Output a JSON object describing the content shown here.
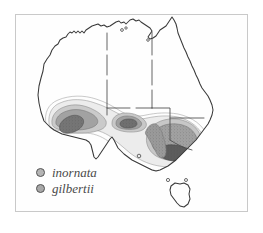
{
  "figure": {
    "type": "distribution-map",
    "region": "Australia",
    "frame": {
      "visible": true,
      "color": "#c9c9c9"
    },
    "background_color": "#ffffff"
  },
  "map": {
    "name": "australia-outline",
    "coastline_color": "#3a3a3a",
    "state_border_color": "#4a4a4a",
    "islands": [
      "Tasmania"
    ],
    "state_borders_visible": true
  },
  "legend": {
    "name": "species-legend",
    "items": [
      {
        "label": "inornata",
        "marker": "circle-marker",
        "fill": "#b4b4b4",
        "stroke": "#545454"
      },
      {
        "label": "gilbertii",
        "marker": "circle-marker",
        "fill": "#a8a8a8",
        "stroke": "#545454"
      }
    ]
  },
  "distribution": {
    "shading_levels": [
      {
        "name": "outermost-contour",
        "color": "#ffffff",
        "stroke": "#9a9a9a"
      },
      {
        "name": "outer-band",
        "color": "#e8e8e8",
        "stroke": "#9a9a9a"
      },
      {
        "name": "mid-band",
        "color": "#c6c6c6",
        "stroke": "#8a8a8a"
      },
      {
        "name": "inner-band",
        "color": "#9e9e9e",
        "stroke": "#777777"
      },
      {
        "name": "core-band",
        "color": "#6f6f6f",
        "stroke": "#555555"
      }
    ],
    "ranges": [
      {
        "name": "southwest-range",
        "species": "inornata"
      },
      {
        "name": "nullarbor-range",
        "species": "inornata"
      },
      {
        "name": "southeast-range",
        "species": "gilbertii"
      }
    ]
  }
}
